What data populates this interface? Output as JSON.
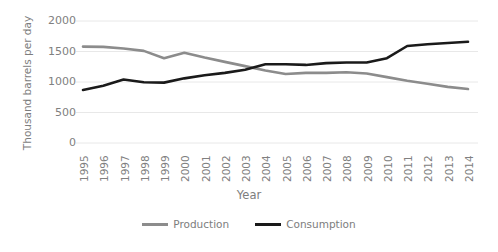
{
  "chart_data": {
    "type": "line",
    "title": "",
    "xlabel": "Year",
    "ylabel": "Thousand barrels per day",
    "categories": [
      "1995",
      "1996",
      "1997",
      "1998",
      "1999",
      "2000",
      "2001",
      "2002",
      "2003",
      "2004",
      "2005",
      "2006",
      "2007",
      "2008",
      "2009",
      "2010",
      "2011",
      "2012",
      "2013",
      "2014"
    ],
    "x": [
      1995,
      1996,
      1997,
      1998,
      1999,
      2000,
      2001,
      2002,
      2003,
      2004,
      2005,
      2006,
      2007,
      2008,
      2009,
      2010,
      2011,
      2012,
      2013,
      2014
    ],
    "series": [
      {
        "name": "Production",
        "color": "#8c8c8c",
        "values": [
          1580,
          1575,
          1550,
          1510,
          1390,
          1480,
          1400,
          1330,
          1260,
          1190,
          1130,
          1150,
          1150,
          1160,
          1140,
          1080,
          1020,
          970,
          920,
          885
        ]
      },
      {
        "name": "Consumption",
        "color": "#1a1a1a",
        "values": [
          870,
          940,
          1040,
          995,
          990,
          1060,
          1110,
          1150,
          1200,
          1290,
          1290,
          1280,
          1310,
          1320,
          1320,
          1390,
          1590,
          1620,
          1640,
          1660
        ]
      }
    ],
    "ylim": [
      0,
      2000
    ],
    "yticks": [
      0,
      500,
      1000,
      1500,
      2000
    ],
    "ytick_labels": [
      "0",
      "500",
      "1000",
      "1500",
      "2000"
    ],
    "grid": "horizontal",
    "legend_position": "bottom",
    "xtick_rotation": 90
  },
  "legend": {
    "items": [
      {
        "label": "Production",
        "color": "#8c8c8c"
      },
      {
        "label": "Consumption",
        "color": "#1a1a1a"
      }
    ]
  },
  "axes": {
    "x_title": "Year",
    "y_title": "Thousand barrels per day"
  },
  "colors": {
    "background": "#ffffff",
    "gridline": "#e8e8e8",
    "text": "#808080",
    "production": "#8c8c8c",
    "consumption": "#1a1a1a"
  }
}
